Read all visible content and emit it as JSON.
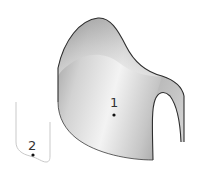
{
  "figure": {
    "points": [
      {
        "label": "1",
        "x": 114,
        "y": 115,
        "on": "surface"
      },
      {
        "label": "2",
        "x": 33,
        "y": 155,
        "on": "curve"
      }
    ],
    "colors": {
      "background": "#ffffff",
      "surface_light": "#f4f4f4",
      "surface_mid": "#c8c8c8",
      "surface_dark": "#8e8e8e",
      "edge": "#2e2e2e",
      "curve": "#c9c9c9",
      "point": "#111111"
    }
  }
}
